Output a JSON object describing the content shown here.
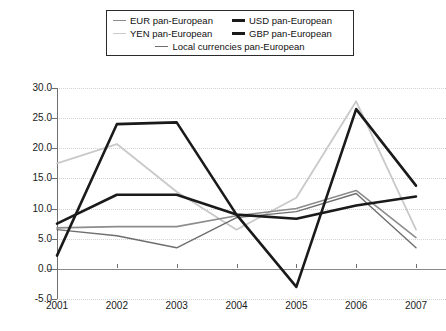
{
  "legend": {
    "items": [
      {
        "label": "EUR pan-European",
        "key": "EUR",
        "color": "#8c8c8c",
        "width": 1.6
      },
      {
        "label": "USD pan-European",
        "key": "USD",
        "color": "#1a1a1a",
        "width": 2.6
      },
      {
        "label": "YEN pan-European",
        "key": "YEN",
        "color": "#c9c9c9",
        "width": 1.8
      },
      {
        "label": "GBP pan-European",
        "key": "GBP",
        "color": "#1a1a1a",
        "width": 2.6
      },
      {
        "label": "Local currencies pan-European",
        "key": "LOCAL",
        "color": "#6e6e6e",
        "width": 1.4
      }
    ]
  },
  "axes": {
    "y_ticks": [
      "30.0",
      "25.0",
      "20.0",
      "15.0",
      "10.0",
      "5.0",
      "0.0",
      "-5.0"
    ],
    "x_ticks": [
      "2001",
      "2002",
      "2003",
      "2004",
      "2005",
      "2006",
      "2007"
    ]
  },
  "chart_data": {
    "type": "line",
    "title": "",
    "xlabel": "",
    "ylabel": "",
    "categories": [
      2001,
      2002,
      2003,
      2004,
      2005,
      2006,
      2007
    ],
    "ylim": [
      -5.0,
      30.0
    ],
    "ytick_step": 5.0,
    "grid": "horizontal-dotted",
    "legend_position": "top",
    "series": [
      {
        "name": "EUR pan-European",
        "color": "#8c8c8c",
        "width": 1.6,
        "values": [
          6.8,
          7.0,
          7.0,
          8.8,
          10.0,
          13.0,
          5.2
        ]
      },
      {
        "name": "USD pan-European",
        "color": "#1a1a1a",
        "width": 2.6,
        "values": [
          2.2,
          24.0,
          24.3,
          9.0,
          8.3,
          10.5,
          12.0
        ]
      },
      {
        "name": "YEN pan-European",
        "color": "#c9c9c9",
        "width": 1.8,
        "values": [
          17.5,
          20.7,
          12.8,
          6.5,
          11.8,
          27.8,
          6.5
        ]
      },
      {
        "name": "GBP pan-European",
        "color": "#1a1a1a",
        "width": 2.6,
        "values": [
          7.5,
          12.3,
          12.3,
          9.0,
          -3.0,
          26.5,
          13.8
        ]
      },
      {
        "name": "Local currencies pan-European",
        "color": "#6e6e6e",
        "width": 1.4,
        "values": [
          6.5,
          5.5,
          3.5,
          8.5,
          9.5,
          12.5,
          3.5
        ]
      }
    ]
  }
}
